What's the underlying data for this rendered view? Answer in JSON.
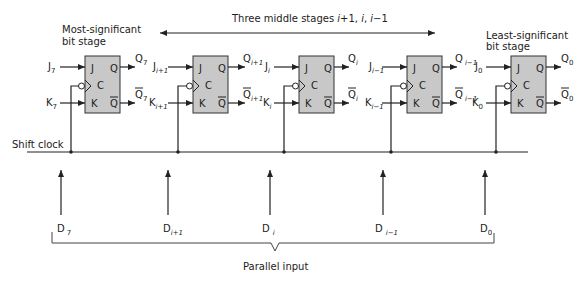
{
  "labels": {
    "msb_line1": "Most-significant",
    "msb_line2": "bit stage",
    "lsb_line1": "Least-significant",
    "lsb_line2": "bit stage",
    "middle_prefix": "Three middle stages ",
    "middle_i": "i",
    "middle_p1": "+1, ",
    "middle_i2": "i",
    "middle_comma": ", ",
    "middle_i3": "i",
    "middle_m1": "−1",
    "shift_clock": "Shift clock",
    "parallel_input": "Parallel input"
  },
  "pins": {
    "j": "J",
    "k": "K",
    "c": "C",
    "q": "Q",
    "qbar": "Q"
  },
  "stages": [
    {
      "j_base": "J",
      "j_sub": "7",
      "k_base": "K",
      "k_sub": "7",
      "q_base": "Q",
      "q_sub": "7",
      "qb_base": "Q",
      "qb_sub": "7",
      "d_base": "D",
      "d_sub": "7"
    },
    {
      "j_base": "J",
      "j_sub": "i+1",
      "k_base": "K",
      "k_sub": "i+1",
      "q_base": "Q",
      "q_sub": "i+1",
      "qb_base": "Q",
      "qb_sub": "i+1",
      "d_base": "D",
      "d_sub": "i+1"
    },
    {
      "j_base": "J",
      "j_sub": "i",
      "k_base": "K",
      "k_sub": "i",
      "q_base": "Q",
      "q_sub": "i",
      "qb_base": "Q",
      "qb_sub": "i",
      "d_base": "D",
      "d_sub": "i"
    },
    {
      "j_base": "J",
      "j_sub": "i−1",
      "k_base": "K",
      "k_sub": "i−1",
      "q_base": "Q",
      "q_sub": "i−1",
      "qb_base": "Q",
      "qb_sub": "i−1",
      "d_base": "D",
      "d_sub": "i−1"
    },
    {
      "j_base": "J",
      "j_sub": "0",
      "k_base": "K",
      "k_sub": "0",
      "q_base": "Q",
      "q_sub": "0",
      "qb_base": "Q",
      "qb_sub": "0",
      "d_base": "D",
      "d_sub": "0"
    }
  ]
}
